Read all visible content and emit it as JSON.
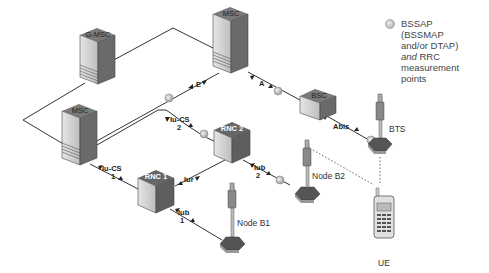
{
  "nodes": {
    "gmsc": {
      "label": "G-MSC"
    },
    "msc_top": {
      "label": "MSC"
    },
    "msc_left": {
      "label": "MSC"
    },
    "bsc": {
      "label": "BSC"
    },
    "rnc1": {
      "label": "RNC 1"
    },
    "rnc2": {
      "label": "RNC 2"
    },
    "bts": {
      "label": "BTS"
    },
    "nodeb1": {
      "label": "Node B1"
    },
    "nodeb2": {
      "label": "Node B2"
    },
    "ue": {
      "label": "UE"
    }
  },
  "interfaces": {
    "e": {
      "label": "E"
    },
    "a": {
      "label": "A"
    },
    "abis": {
      "label": "Abis"
    },
    "iucs2": {
      "label": "Iu-CS",
      "num": "2"
    },
    "iucs1": {
      "label": "Iu-CS",
      "num": "1"
    },
    "iur": {
      "label": "Iur"
    },
    "iub1": {
      "label": "Iub",
      "num": "1"
    },
    "iub2": {
      "label": "Iub",
      "num": "2"
    }
  },
  "legend": {
    "line1": "BSSAP",
    "line2": "(BSSMAP",
    "line3": "and/or DTAP)",
    "line4_em": "and",
    "line4_rest": " RRC",
    "line5": "measurement",
    "line6": "points"
  },
  "colors": {
    "line": "#333333",
    "box_dark": "#6e6e6e",
    "box_light": "#d8d8d8",
    "probe": "#b0b0b0"
  }
}
